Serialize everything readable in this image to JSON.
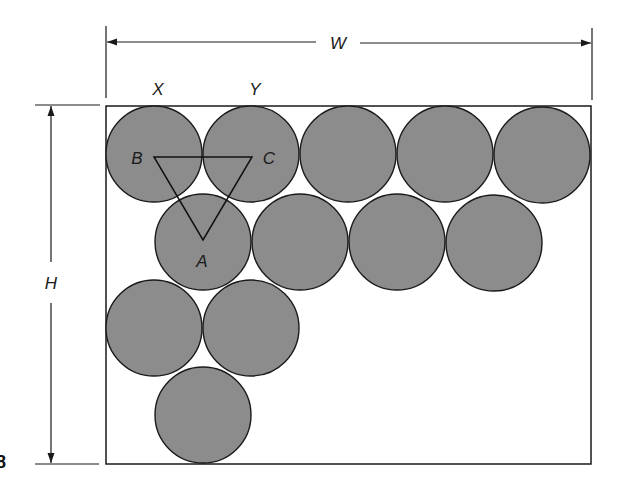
{
  "figure": {
    "type": "circle-packing-in-rectangle",
    "circle_radius": 48,
    "circle_fill": "#8c8c8c",
    "outline_color": "#1a1a1a",
    "background": "#ffffff"
  },
  "dimensions": {
    "width_label": "W",
    "height_label": "H"
  },
  "circle_labels": {
    "x_label": "X",
    "y_label": "Y"
  },
  "triangle": {
    "vertex_a": "A",
    "vertex_b": "B",
    "vertex_c": "C"
  },
  "rows": [
    {
      "count": 5,
      "centers_x": [
        154,
        251,
        348,
        445,
        542
      ],
      "center_y": 154
    },
    {
      "count": 4,
      "centers_x": [
        203,
        300,
        397,
        494
      ],
      "center_y": 242
    },
    {
      "count": 2,
      "centers_x": [
        154,
        251
      ],
      "center_y": 328
    },
    {
      "count": 1,
      "centers_x": [
        203
      ],
      "center_y": 415
    }
  ],
  "margin_fragment": "8"
}
